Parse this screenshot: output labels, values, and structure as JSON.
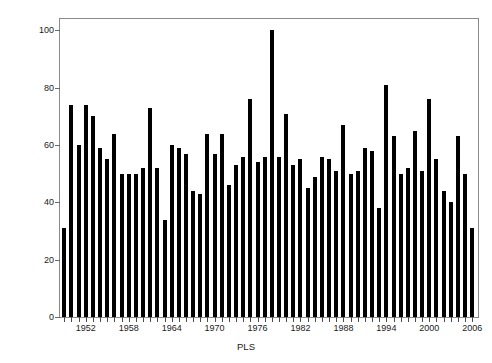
{
  "chart_data": {
    "type": "bar",
    "title": "",
    "xlabel": "PLS",
    "ylabel": "Number of detected cases",
    "ylim": [
      0,
      104
    ],
    "xlim": [
      1948.4,
      2006.8
    ],
    "grid": false,
    "legend": null,
    "ytick_labels": [
      "0",
      "20",
      "40",
      "60",
      "80",
      "100"
    ],
    "ytick_values": [
      0,
      20,
      40,
      60,
      80,
      100
    ],
    "xtick_labels": [
      "1952",
      "1958",
      "1964",
      "1970",
      "1976",
      "1982",
      "1988",
      "1994",
      "2000",
      "2006"
    ],
    "xtick_values": [
      1952,
      1958,
      1964,
      1970,
      1976,
      1982,
      1988,
      1994,
      2000,
      2006
    ],
    "minor_xticks_every": 1,
    "bar_color": "#000000",
    "categories": [
      1949,
      1950,
      1951,
      1952,
      1953,
      1954,
      1955,
      1956,
      1957,
      1958,
      1959,
      1960,
      1961,
      1962,
      1963,
      1964,
      1965,
      1966,
      1967,
      1968,
      1969,
      1970,
      1971,
      1972,
      1973,
      1974,
      1975,
      1976,
      1977,
      1978,
      1979,
      1980,
      1981,
      1982,
      1983,
      1984,
      1985,
      1986,
      1987,
      1988,
      1989,
      1990,
      1991,
      1992,
      1993,
      1994,
      1995,
      1996,
      1997,
      1998,
      1999,
      2000,
      2001,
      2002,
      2003,
      2004,
      2005,
      2006
    ],
    "values": [
      31,
      74,
      60,
      74,
      70,
      59,
      55,
      64,
      50,
      50,
      50,
      52,
      73,
      52,
      34,
      60,
      59,
      57,
      44,
      43,
      64,
      57,
      64,
      46,
      53,
      56,
      76,
      54,
      56,
      100,
      56,
      71,
      53,
      55,
      45,
      49,
      56,
      55,
      51,
      67,
      50,
      51,
      59,
      58,
      38,
      81,
      63,
      50,
      52,
      65,
      51,
      76,
      55,
      44,
      40,
      63,
      50,
      31
    ]
  },
  "axes": {
    "y_axis_title": "Number of detected cases",
    "x_axis_title": "PLS"
  }
}
